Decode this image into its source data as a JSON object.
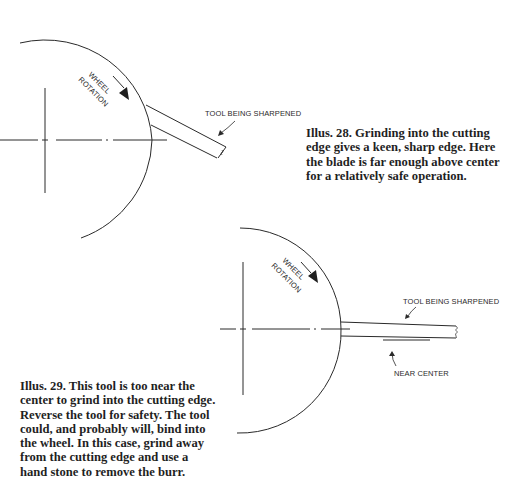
{
  "figures": [
    {
      "id": "illus-28",
      "labels": {
        "rotation_line1": "WHEEL",
        "rotation_line2": "ROTATION",
        "tool": "TOOL BEING SHARPENED"
      },
      "caption_lines": [
        "Illus. 28.  Grinding into the cutting",
        "edge gives a keen, sharp edge. Here",
        "the blade is far enough above center",
        "for a relatively safe operation."
      ]
    },
    {
      "id": "illus-29",
      "labels": {
        "rotation_line1": "WHEEL",
        "rotation_line2": "ROTATION",
        "tool": "TOOL BEING SHARPENED",
        "near_center": "NEAR CENTER"
      },
      "caption_lines": [
        "Illus. 29.  This tool is too near the",
        "center to grind into the cutting edge.",
        "Reverse the tool for safety. The tool",
        "could, and probably will, bind into",
        "the wheel. In this case, grind away",
        "from the cutting edge and use a",
        "hand stone to remove the burr."
      ]
    }
  ],
  "colors": {
    "ink": "#2a2a2a",
    "paper": "#ffffff"
  }
}
